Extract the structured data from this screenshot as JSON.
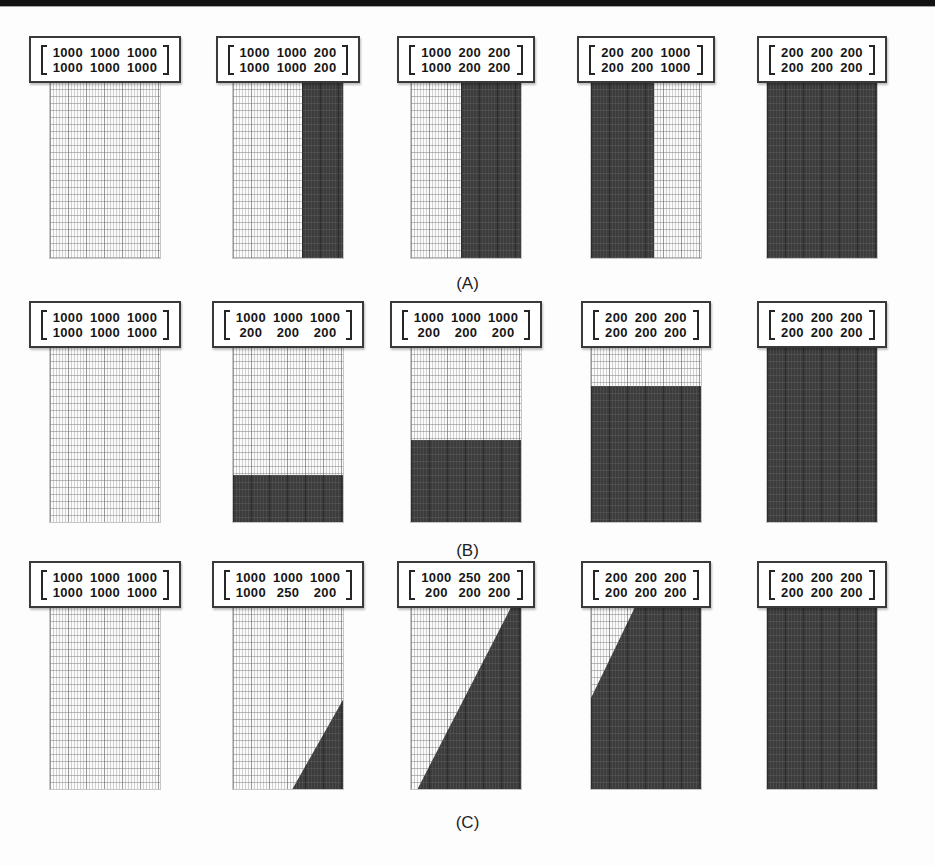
{
  "figure": {
    "colors": {
      "dark_shade": "#3c3c3c",
      "light_fabric": "#ededed",
      "box_border": "#3a3a3a",
      "top_rule": "#121212"
    },
    "rows": [
      {
        "caption": "(A)",
        "panels": [
          {
            "matrix": {
              "row1": [
                "1000",
                "1000",
                "1000"
              ],
              "row2": [
                "1000",
                "1000",
                "1000"
              ]
            },
            "shade": {
              "type": "none"
            }
          },
          {
            "matrix": {
              "row1": [
                "1000",
                "1000",
                "200"
              ],
              "row2": [
                "1000",
                "1000",
                "200"
              ]
            },
            "shade": {
              "type": "vertical",
              "side": "right",
              "fraction": 37
            }
          },
          {
            "matrix": {
              "row1": [
                "1000",
                "200",
                "200"
              ],
              "row2": [
                "1000",
                "200",
                "200"
              ]
            },
            "shade": {
              "type": "vertical",
              "side": "right",
              "fraction": 55
            }
          },
          {
            "matrix": {
              "row1": [
                "200",
                "200",
                "1000"
              ],
              "row2": [
                "200",
                "200",
                "1000"
              ]
            },
            "shade": {
              "type": "vertical",
              "side": "left",
              "fraction": 57
            }
          },
          {
            "matrix": {
              "row1": [
                "200",
                "200",
                "200"
              ],
              "row2": [
                "200",
                "200",
                "200"
              ]
            },
            "shade": {
              "type": "full"
            }
          }
        ]
      },
      {
        "caption": "(B)",
        "panels": [
          {
            "matrix": {
              "row1": [
                "1000",
                "1000",
                "1000"
              ],
              "row2": [
                "1000",
                "1000",
                "1000"
              ]
            },
            "shade": {
              "type": "none"
            }
          },
          {
            "matrix": {
              "row1": [
                "1000",
                "1000",
                "1000"
              ],
              "row2": [
                "200",
                "200",
                "200"
              ]
            },
            "shade": {
              "type": "horizontal",
              "side": "bottom",
              "fraction": 27
            }
          },
          {
            "matrix": {
              "row1": [
                "1000",
                "1000",
                "1000"
              ],
              "row2": [
                "200",
                "200",
                "200"
              ]
            },
            "shade": {
              "type": "horizontal",
              "side": "bottom",
              "fraction": 47
            }
          },
          {
            "matrix": {
              "row1": [
                "200",
                "200",
                "200"
              ],
              "row2": [
                "200",
                "200",
                "200"
              ]
            },
            "shade": {
              "type": "horizontal",
              "side": "bottom",
              "fraction": 78
            }
          },
          {
            "matrix": {
              "row1": [
                "200",
                "200",
                "200"
              ],
              "row2": [
                "200",
                "200",
                "200"
              ]
            },
            "shade": {
              "type": "full"
            }
          }
        ]
      },
      {
        "caption": "(C)",
        "panels": [
          {
            "matrix": {
              "row1": [
                "1000",
                "1000",
                "1000"
              ],
              "row2": [
                "1000",
                "1000",
                "1000"
              ]
            },
            "shade": {
              "type": "none"
            }
          },
          {
            "matrix": {
              "row1": [
                "1000",
                "1000",
                "1000"
              ],
              "row2": [
                "1000",
                "250",
                "200"
              ]
            },
            "shade": {
              "type": "diagonal",
              "clip": "polygon(54% 100%, 100% 51%, 100% 100%)"
            }
          },
          {
            "matrix": {
              "row1": [
                "1000",
                "250",
                "200"
              ],
              "row2": [
                "200",
                "200",
                "200"
              ]
            },
            "shade": {
              "type": "diagonal",
              "clip": "polygon(91% 0%, 100% 0%, 100% 100%, 6% 100%)"
            }
          },
          {
            "matrix": {
              "row1": [
                "200",
                "200",
                "200"
              ],
              "row2": [
                "200",
                "200",
                "200"
              ]
            },
            "shade": {
              "type": "diagonal",
              "clip": "polygon(40% 0%, 100% 0%, 100% 100%, 0% 100%, 0% 50%)"
            }
          },
          {
            "matrix": {
              "row1": [
                "200",
                "200",
                "200"
              ],
              "row2": [
                "200",
                "200",
                "200"
              ]
            },
            "shade": {
              "type": "full"
            }
          }
        ]
      }
    ]
  }
}
